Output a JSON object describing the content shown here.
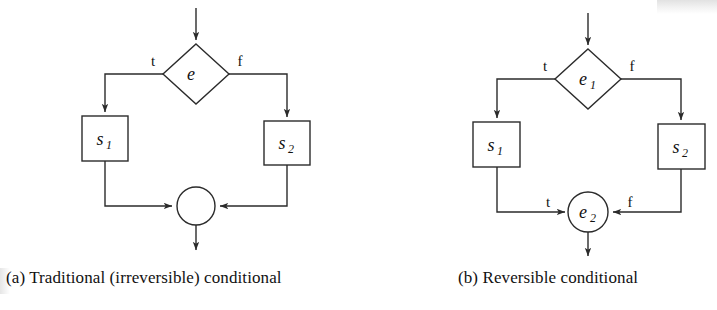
{
  "figure": {
    "background_color": "#ffffff",
    "stroke_color": "#2b2b2b",
    "text_color": "#111111"
  },
  "panels": [
    {
      "id": "a",
      "caption": "(a) Traditional (irreversible) conditional",
      "decision": {
        "label": "e",
        "subscript": "",
        "shape": "diamond"
      },
      "merge": {
        "label": "",
        "subscript": "",
        "shape": "circle"
      },
      "statements": [
        {
          "label": "s",
          "subscript": "1",
          "shape": "rectangle"
        },
        {
          "label": "s",
          "subscript": "2",
          "shape": "rectangle"
        }
      ],
      "edge_labels": {
        "decision_true": "t",
        "decision_false": "f",
        "merge_true": "",
        "merge_false": ""
      }
    },
    {
      "id": "b",
      "caption": "(b) Reversible conditional",
      "decision": {
        "label": "e",
        "subscript": "1",
        "shape": "diamond"
      },
      "merge": {
        "label": "e",
        "subscript": "2",
        "shape": "circle"
      },
      "statements": [
        {
          "label": "s",
          "subscript": "1",
          "shape": "rectangle"
        },
        {
          "label": "s",
          "subscript": "2",
          "shape": "rectangle"
        }
      ],
      "edge_labels": {
        "decision_true": "t",
        "decision_false": "f",
        "merge_true": "t",
        "merge_false": "f"
      }
    }
  ]
}
